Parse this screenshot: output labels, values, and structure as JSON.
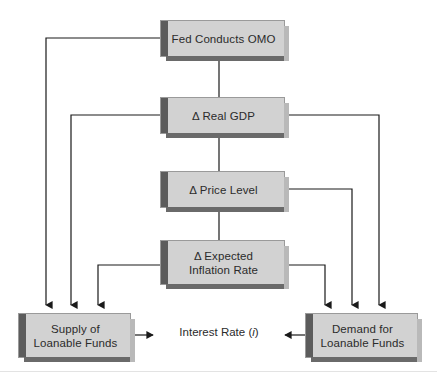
{
  "diagram": {
    "title_text": "Loanable Funds Flowchart",
    "accent_color": "#5c5c5c",
    "box_fill_color": "#d2d2d2",
    "line_color": "#1a1a1a",
    "text_color": "#2b2b2b",
    "type": "flowchart"
  },
  "nodes": {
    "fed_omo": {
      "label": "Fed Conducts OMO"
    },
    "real_gdp": {
      "label": "Δ Real GDP"
    },
    "price_level": {
      "label": "Δ Price Level"
    },
    "expected_inflation": {
      "label": "Δ Expected\nInflation Rate"
    },
    "supply": {
      "label": "Supply of\nLoanable Funds"
    },
    "demand": {
      "label": "Demand for\nLoanable Funds"
    }
  },
  "center": {
    "prefix": "Interest Rate (",
    "variable": "i",
    "suffix": ")"
  },
  "edges": [
    {
      "name": "fed-omo-to-real-gdp",
      "from": "fed_omo",
      "to": "real_gdp",
      "arrow": false
    },
    {
      "name": "real-gdp-to-price-level",
      "from": "real_gdp",
      "to": "price_level",
      "arrow": false
    },
    {
      "name": "price-level-to-expected-inflation",
      "from": "price_level",
      "to": "expected_inflation",
      "arrow": false
    },
    {
      "name": "fed-omo-to-supply",
      "from": "fed_omo",
      "to": "supply",
      "arrow": true
    },
    {
      "name": "real-gdp-to-supply",
      "from": "real_gdp",
      "to": "supply",
      "arrow": true
    },
    {
      "name": "expected-inflation-to-supply",
      "from": "expected_inflation",
      "to": "supply",
      "arrow": true
    },
    {
      "name": "real-gdp-to-demand",
      "from": "real_gdp",
      "to": "demand",
      "arrow": true
    },
    {
      "name": "price-level-to-demand",
      "from": "price_level",
      "to": "demand",
      "arrow": true
    },
    {
      "name": "expected-inflation-to-demand",
      "from": "expected_inflation",
      "to": "demand",
      "arrow": true
    },
    {
      "name": "supply-to-interest-rate",
      "from": "supply",
      "to": "center",
      "arrow": true
    },
    {
      "name": "demand-to-interest-rate",
      "from": "demand",
      "to": "center",
      "arrow": true
    }
  ]
}
